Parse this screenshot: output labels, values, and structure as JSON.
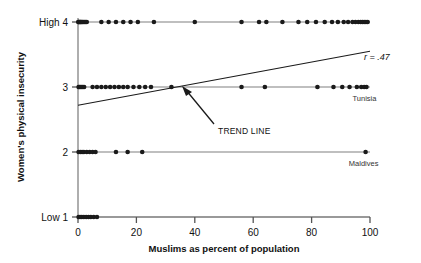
{
  "chart_data": {
    "type": "scatter",
    "title": "",
    "xlabel": "Muslims as percent of population",
    "ylabel": "Women's physical insecurity",
    "xlim": [
      0,
      100
    ],
    "ylim": [
      1,
      4
    ],
    "xticks": [
      0,
      20,
      40,
      60,
      80,
      100
    ],
    "xticklabels": [
      "0",
      "20",
      "40",
      "60",
      "80",
      "100"
    ],
    "yticks": [
      1,
      2,
      3,
      4
    ],
    "yticklabels": [
      "Low 1",
      "2",
      "3",
      "High 4"
    ],
    "grid": false,
    "legend": "none",
    "series": [
      {
        "name": "countries",
        "x": [
          0.1,
          0.2,
          0.4,
          0.6,
          0.8,
          1.0,
          1.2,
          1.5,
          1.8,
          2.2,
          2.6,
          3.0,
          8.0,
          10.5,
          13.0,
          15.5,
          18.0,
          20.5,
          26.0,
          40.0,
          56.0,
          62.0,
          64.5,
          70.0,
          75.5,
          78.5,
          81.5,
          84.5,
          87.0,
          89.0,
          91.0,
          92.5,
          94.0,
          95.0,
          96.0,
          96.8,
          97.4,
          98.0,
          98.6,
          99.2
        ],
        "y": [
          4,
          4,
          4,
          4,
          4,
          4,
          4,
          4,
          4,
          4,
          4,
          4,
          4,
          4,
          4,
          4,
          4,
          4,
          4,
          4,
          4,
          4,
          4,
          4,
          4,
          4,
          4,
          4,
          4,
          4,
          4,
          4,
          4,
          4,
          4,
          4,
          4,
          4,
          4,
          4
        ]
      },
      {
        "name": "countries-level3",
        "x": [
          0.2,
          0.5,
          0.9,
          1.3,
          1.7,
          2.1,
          5.0,
          6.5,
          8.0,
          9.5,
          11.0,
          12.5,
          14.0,
          15.5,
          17.0,
          19.0,
          21.0,
          23.0,
          25.0,
          32.0,
          56.0,
          64.0,
          82.0,
          87.5,
          90.5,
          93.0,
          95.5,
          97.0,
          98.0,
          98.8
        ],
        "y": [
          3,
          3,
          3,
          3,
          3,
          3,
          3,
          3,
          3,
          3,
          3,
          3,
          3,
          3,
          3,
          3,
          3,
          3,
          3,
          3,
          3,
          3,
          3,
          3,
          3,
          3,
          3,
          3,
          3,
          3
        ]
      },
      {
        "name": "countries-level2",
        "x": [
          0.2,
          0.8,
          1.4,
          2.0,
          3.0,
          4.0,
          5.0,
          6.0,
          13.0,
          17.0,
          22.0,
          98.5
        ],
        "y": [
          2,
          2,
          2,
          2,
          2,
          2,
          2,
          2,
          2,
          2,
          2,
          2
        ]
      },
      {
        "name": "countries-level1",
        "x": [
          0.2,
          0.7,
          1.3,
          2.0,
          2.8,
          3.6,
          4.4,
          5.4,
          6.5
        ],
        "y": [
          1,
          1,
          1,
          1,
          1,
          1,
          1,
          1,
          1
        ]
      }
    ],
    "trendline": {
      "x0": 0,
      "y0": 2.72,
      "x1": 100,
      "y1": 3.55,
      "label": "TREND LINE",
      "correlation_label": "r = .47",
      "correlation": 0.47
    },
    "point_labels": [
      {
        "text": "Tunisia",
        "x": 98.8,
        "y": 3
      },
      {
        "text": "Maldives",
        "x": 98.5,
        "y": 2
      }
    ],
    "marker_color": "#1a1a1a",
    "line_color": "#808080",
    "trend_color": "#1a1a1a"
  }
}
